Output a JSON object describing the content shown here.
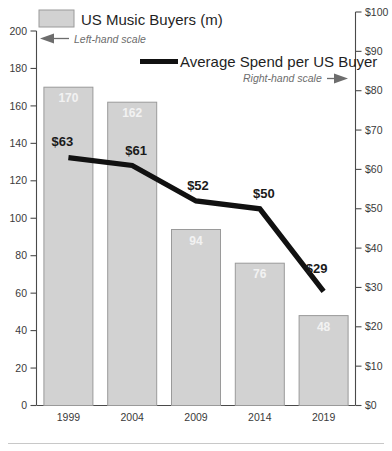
{
  "chart_data": {
    "type": "bar",
    "title": "",
    "categories": [
      "1999",
      "2004",
      "2009",
      "2014",
      "2019"
    ],
    "xlabel": "",
    "grid": false,
    "legend_position": "top",
    "series": [
      {
        "name": "US Music Buyers (m)",
        "type": "bar",
        "axis": "left",
        "scale_note": "Left-hand scale",
        "values": [
          170,
          162,
          94,
          76,
          48
        ],
        "value_labels": [
          "170",
          "162",
          "94",
          "76",
          "48"
        ],
        "color": "#d2d2d2",
        "border_color": "#9a9a9a"
      },
      {
        "name": "Average Spend per US Buyer",
        "type": "line",
        "axis": "right",
        "scale_note": "Right-hand scale",
        "values": [
          63,
          61,
          52,
          50,
          29
        ],
        "value_labels": [
          "$63",
          "$61",
          "$52",
          "$50",
          "$29"
        ],
        "color": "#111111"
      }
    ],
    "left_axis": {
      "label": "",
      "ylim": [
        0,
        200
      ],
      "tick_step": 20,
      "ticks": [
        0,
        20,
        40,
        60,
        80,
        100,
        120,
        140,
        160,
        180,
        200
      ],
      "tick_labels": [
        "0",
        "20",
        "40",
        "60",
        "80",
        "100",
        "120",
        "140",
        "160",
        "180",
        "200"
      ]
    },
    "right_axis": {
      "label": "",
      "ylim": [
        0,
        100
      ],
      "tick_step": 10,
      "ticks": [
        0,
        10,
        20,
        30,
        40,
        50,
        60,
        70,
        80,
        90,
        100
      ],
      "tick_labels": [
        "$0",
        "$10",
        "$20",
        "$30",
        "$40",
        "$50",
        "$60",
        "$70",
        "$80",
        "$90",
        "$100"
      ]
    }
  },
  "legend": {
    "bars": {
      "label": "US Music Buyers (m)",
      "scale_note": "Left-hand scale"
    },
    "line": {
      "label": "Average Spend per US Buyer",
      "scale_note": "Right-hand scale"
    }
  }
}
